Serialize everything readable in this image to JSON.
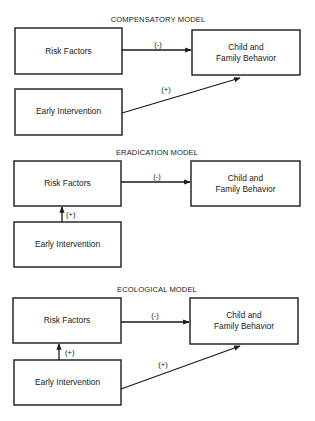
{
  "colors": {
    "stroke": "#1a1a1a",
    "background": "#ffffff"
  },
  "models": [
    {
      "title": "COMPENSATORY MODEL",
      "nodes": {
        "risk": "Risk Factors",
        "child_line1": "Child and",
        "child_line2": "Family Behavior",
        "intervention": "Early Intervention"
      },
      "edges": [
        {
          "from": "Risk Factors",
          "to": "Child and Family Behavior",
          "label": "(-)"
        },
        {
          "from": "Early Intervention",
          "to": "Child and Family Behavior",
          "label": "(+)"
        }
      ]
    },
    {
      "title": "ERADICATION MODEL",
      "nodes": {
        "risk": "Risk Factors",
        "child_line1": "Child and",
        "child_line2": "Family Behavior",
        "intervention": "Early Intervention"
      },
      "edges": [
        {
          "from": "Risk Factors",
          "to": "Child and Family Behavior",
          "label": "(-)"
        },
        {
          "from": "Early Intervention",
          "to": "Risk Factors",
          "label": "(+)"
        }
      ]
    },
    {
      "title": "ECOLOGICAL MODEL",
      "nodes": {
        "risk": "Risk Factors",
        "child_line1": "Child and",
        "child_line2": "Family Behavior",
        "intervention": "Early Intervention"
      },
      "edges": [
        {
          "from": "Risk Factors",
          "to": "Child and Family Behavior",
          "label": "(-)"
        },
        {
          "from": "Early Intervention",
          "to": "Risk Factors",
          "label": "(+)"
        },
        {
          "from": "Early Intervention",
          "to": "Child and Family Behavior",
          "label": "(+)"
        }
      ]
    }
  ]
}
